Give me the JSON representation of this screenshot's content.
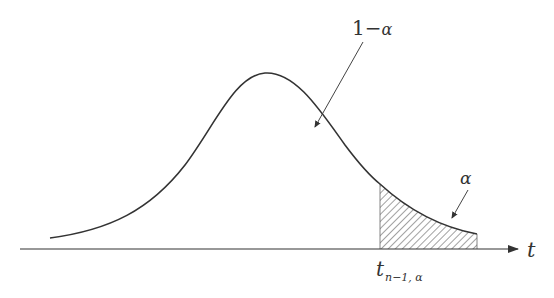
{
  "diagram": {
    "type": "t-distribution-critical-region",
    "labels": {
      "central_area": "1−",
      "central_area_symbol": "α",
      "tail_area": "α",
      "axis_variable": "t",
      "critical_value_base": "t",
      "critical_value_subscript": "n−1, α"
    },
    "colors": {
      "stroke": "#333333",
      "background": "#ffffff"
    }
  }
}
